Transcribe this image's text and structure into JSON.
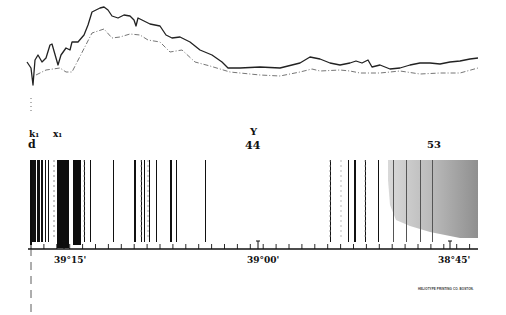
{
  "figure": {
    "type": "solar spectrum plate with intensity tracing",
    "labels": {
      "k1": "k₁",
      "x1": "x₁",
      "d": "d",
      "Y": "Y",
      "n44": "44",
      "n53": "53"
    },
    "scale": {
      "ticks": [
        {
          "label": "39°15'",
          "x": 64
        },
        {
          "label": "39°00'",
          "x": 258
        },
        {
          "label": "38°45'",
          "x": 450
        }
      ],
      "tick_start_x": 31,
      "tick_end_x": 475,
      "tick_spacing_px": 12.9
    },
    "credit": "HELIOTYPE PRINTING CO. BOSTON."
  },
  "chart_data": {
    "type": "line",
    "title": "",
    "xlabel": "",
    "ylabel": "",
    "grid": false,
    "x_axis_labels": [
      "39°15'",
      "39°00'",
      "38°45'"
    ],
    "series": [
      {
        "name": "upper trace (solid)",
        "points": [
          [
            27,
            62
          ],
          [
            31,
            68
          ],
          [
            33,
            85
          ],
          [
            35,
            60
          ],
          [
            38,
            55
          ],
          [
            42,
            62
          ],
          [
            46,
            58
          ],
          [
            50,
            45
          ],
          [
            52,
            44
          ],
          [
            58,
            65
          ],
          [
            61,
            55
          ],
          [
            66,
            48
          ],
          [
            70,
            50
          ],
          [
            72,
            42
          ],
          [
            78,
            42
          ],
          [
            84,
            35
          ],
          [
            88,
            25
          ],
          [
            92,
            12
          ],
          [
            100,
            8
          ],
          [
            104,
            7
          ],
          [
            108,
            10
          ],
          [
            112,
            16
          ],
          [
            118,
            18
          ],
          [
            124,
            15
          ],
          [
            130,
            16
          ],
          [
            134,
            20
          ],
          [
            136,
            26
          ],
          [
            138,
            18
          ],
          [
            142,
            20
          ],
          [
            150,
            24
          ],
          [
            160,
            26
          ],
          [
            166,
            35
          ],
          [
            172,
            38
          ],
          [
            180,
            37
          ],
          [
            190,
            42
          ],
          [
            200,
            50
          ],
          [
            212,
            55
          ],
          [
            222,
            62
          ],
          [
            228,
            68
          ],
          [
            240,
            68
          ],
          [
            260,
            67
          ],
          [
            280,
            68
          ],
          [
            300,
            63
          ],
          [
            310,
            57
          ],
          [
            320,
            59
          ],
          [
            330,
            63
          ],
          [
            340,
            65
          ],
          [
            350,
            63
          ],
          [
            356,
            61
          ],
          [
            362,
            63
          ],
          [
            368,
            60
          ],
          [
            372,
            67
          ],
          [
            380,
            65
          ],
          [
            390,
            69
          ],
          [
            400,
            68
          ],
          [
            410,
            65
          ],
          [
            420,
            63
          ],
          [
            430,
            63
          ],
          [
            440,
            64
          ],
          [
            450,
            62
          ],
          [
            460,
            61
          ],
          [
            470,
            59
          ],
          [
            478,
            58
          ]
        ]
      },
      {
        "name": "lower trace (dashed)",
        "points": [
          [
            36,
            75
          ],
          [
            46,
            70
          ],
          [
            60,
            68
          ],
          [
            66,
            72
          ],
          [
            72,
            72
          ],
          [
            92,
            33
          ],
          [
            104,
            29
          ],
          [
            112,
            38
          ],
          [
            120,
            37
          ],
          [
            130,
            34
          ],
          [
            140,
            35
          ],
          [
            148,
            40
          ],
          [
            160,
            42
          ],
          [
            170,
            52
          ],
          [
            182,
            50
          ],
          [
            195,
            62
          ],
          [
            210,
            66
          ],
          [
            230,
            72
          ],
          [
            260,
            75
          ],
          [
            280,
            76
          ],
          [
            300,
            72
          ],
          [
            312,
            69
          ],
          [
            320,
            71
          ],
          [
            340,
            70
          ],
          [
            350,
            71
          ],
          [
            360,
            73
          ],
          [
            380,
            73
          ],
          [
            400,
            71
          ],
          [
            420,
            74
          ],
          [
            440,
            73
          ],
          [
            460,
            73
          ],
          [
            478,
            68
          ]
        ]
      }
    ],
    "spectrum": {
      "x_range": [
        31,
        478
      ],
      "y_range": [
        160,
        240
      ],
      "shaded_region_x": [
        388,
        478
      ],
      "lines": [
        {
          "x": 32,
          "w": 4
        },
        {
          "x": 37,
          "w": 3
        },
        {
          "x": 41,
          "w": 2
        },
        {
          "x": 45,
          "w": 1
        },
        {
          "x": 48,
          "w": 1
        },
        {
          "x": 58,
          "w": 6
        },
        {
          "x": 64,
          "w": 3
        },
        {
          "x": 68,
          "w": 1
        },
        {
          "x": 74,
          "w": 5
        },
        {
          "x": 80,
          "w": 1
        },
        {
          "x": 84,
          "w": 1
        },
        {
          "x": 90,
          "w": 1
        },
        {
          "x": 113,
          "w": 1
        },
        {
          "x": 134,
          "w": 2
        },
        {
          "x": 141,
          "w": 1
        },
        {
          "x": 144,
          "w": 1
        },
        {
          "x": 149,
          "w": 1
        },
        {
          "x": 156,
          "w": 1
        },
        {
          "x": 170,
          "w": 2
        },
        {
          "x": 176,
          "w": 1
        },
        {
          "x": 205,
          "w": 1
        },
        {
          "x": 330,
          "w": 1
        },
        {
          "x": 348,
          "w": 1
        },
        {
          "x": 354,
          "w": 2
        },
        {
          "x": 365,
          "w": 1
        },
        {
          "x": 378,
          "w": 1
        },
        {
          "x": 393,
          "w": 1
        },
        {
          "x": 406,
          "w": 1
        },
        {
          "x": 420,
          "w": 1
        },
        {
          "x": 432,
          "w": 1
        }
      ]
    }
  }
}
